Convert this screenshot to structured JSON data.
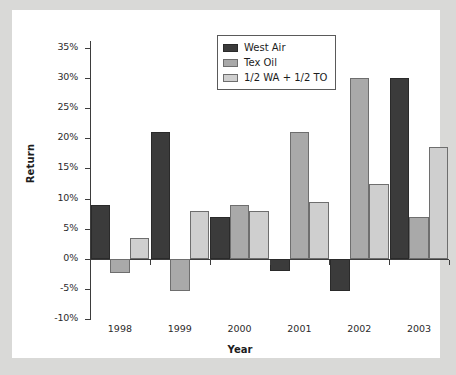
{
  "chart_data": {
    "type": "bar",
    "title": "",
    "xlabel": "Year",
    "ylabel": "Return",
    "categories": [
      "1998",
      "1999",
      "2000",
      "2001",
      "2002",
      "2003"
    ],
    "series": [
      {
        "name": "West Air",
        "color": "#3b3b3b",
        "values": [
          9,
          21,
          7,
          -2,
          -5.3,
          30
        ]
      },
      {
        "name": "Tex Oil",
        "color": "#a9a9a9",
        "values": [
          -2.3,
          -5.3,
          9,
          21,
          30,
          7
        ]
      },
      {
        "name": "1/2 WA + 1/2 TO",
        "color": "#cfcfcf",
        "values": [
          3.5,
          8,
          8,
          9.5,
          12.5,
          18.5
        ]
      }
    ],
    "ylim": [
      -10,
      35
    ],
    "ytick_values": [
      35,
      30,
      25,
      20,
      15,
      10,
      5,
      0,
      -5,
      -10
    ],
    "ytick_labels": [
      "35%",
      "30%",
      "25%",
      "20%",
      "15%",
      "10%",
      "5%",
      "0%",
      "-5%",
      "-10%"
    ],
    "grid": false,
    "legend_position": "top-center",
    "value_format": "percent"
  },
  "legend": {
    "entries": [
      {
        "label": "West Air"
      },
      {
        "label": "Tex Oil"
      },
      {
        "label": "1/2 WA + 1/2 TO"
      }
    ]
  },
  "axes": {
    "y_title": "Return",
    "x_title": "Year"
  },
  "colors": {
    "series_west_air": "#3b3b3b",
    "series_tex_oil": "#a9a9a9",
    "series_blend": "#cfcfcf",
    "axis": "#3d3d3d",
    "card_background": "#ffffff",
    "page_background": "#d9d9d7"
  }
}
